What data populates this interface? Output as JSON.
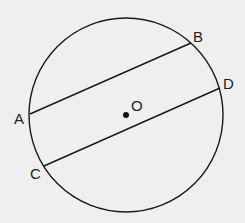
{
  "diagram": {
    "background": "#efefef",
    "circle": {
      "cx": 126,
      "cy": 115,
      "r": 97,
      "stroke": "#1a1a1a"
    },
    "center": {
      "label": "O",
      "x": 126,
      "y": 115,
      "label_x": 131,
      "label_y": 111
    },
    "points": [
      {
        "label": "A",
        "x": 30,
        "y": 114,
        "label_x": 14,
        "label_y": 124
      },
      {
        "label": "B",
        "x": 191,
        "y": 43,
        "label_x": 193,
        "label_y": 42
      },
      {
        "label": "C",
        "x": 44,
        "y": 166,
        "label_x": 30,
        "label_y": 179
      },
      {
        "label": "D",
        "x": 220,
        "y": 88,
        "label_x": 223,
        "label_y": 89
      }
    ],
    "chords": [
      {
        "name": "AB",
        "from": "A",
        "to": "B"
      },
      {
        "name": "CD",
        "from": "C",
        "to": "D"
      }
    ]
  }
}
